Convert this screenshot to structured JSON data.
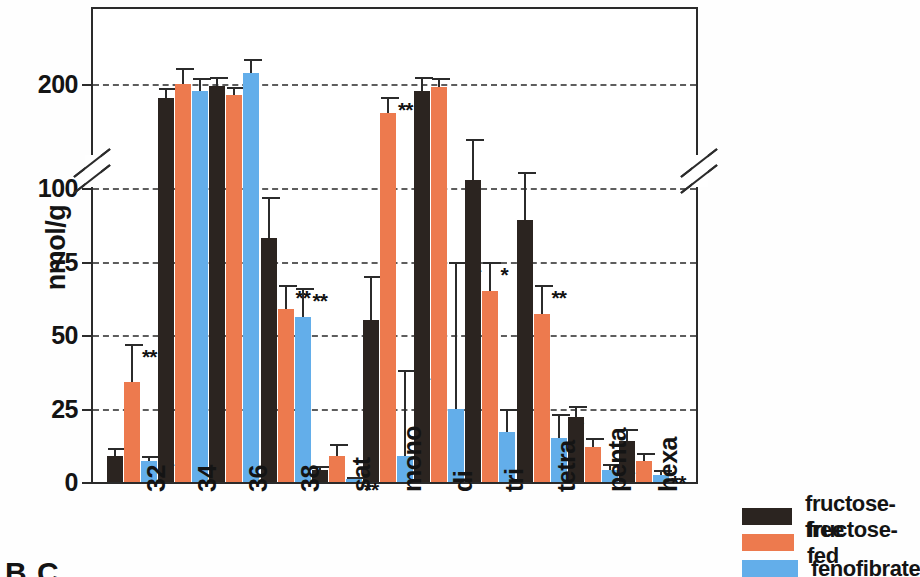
{
  "chart_data": {
    "type": "bar",
    "title": "",
    "xlabel": "",
    "ylabel": "nmol/g",
    "ylim": [
      0,
      230
    ],
    "grid": true,
    "axis_break": {
      "present": true,
      "lower_max": 110,
      "upper_min": 110
    },
    "legend_position": "bottom-right",
    "categories": [
      "32",
      "34",
      "36",
      "38",
      "sat",
      "mono",
      "di",
      "tri",
      "tetra",
      "penta",
      "hexa"
    ],
    "tick_labels": [
      "0",
      "25",
      "50",
      "75",
      "100",
      "200"
    ],
    "series": [
      {
        "name": "fructose-free",
        "color": "#2b2420",
        "values": [
          9,
          180,
          197,
          83,
          4,
          55,
          190,
          102,
          89,
          22,
          14
        ],
        "errors": [
          2.5,
          14,
          13,
          14,
          1.5,
          15,
          20,
          22,
          15,
          4,
          4
        ],
        "significance": [
          "",
          "",
          "",
          "",
          "",
          "",
          "",
          "",
          "",
          "",
          ""
        ]
      },
      {
        "name": "fructose-fed",
        "color": "#ed7a4e",
        "values": [
          34,
          200,
          185,
          59,
          9,
          160,
          196,
          65,
          57,
          12,
          7
        ],
        "errors": [
          13,
          22,
          11,
          8,
          4,
          22,
          13,
          10,
          10,
          3,
          3
        ],
        "significance": [
          "**",
          "",
          "",
          "**",
          "",
          "**",
          "",
          "*",
          "**",
          "",
          ""
        ]
      },
      {
        "name": "fenofibrate",
        "color": "#63aeea",
        "values": [
          7,
          190,
          215,
          56,
          1,
          9,
          25,
          17,
          15,
          4,
          2.5
        ],
        "errors": [
          2,
          18,
          20,
          10,
          0.8,
          29,
          50,
          8,
          8,
          2,
          1.5
        ],
        "significance": [
          "**",
          "",
          "",
          "**",
          "**",
          "**",
          "**",
          "*",
          "**",
          "**",
          "**"
        ]
      }
    ]
  },
  "axis": {
    "y_title": "nmol/g",
    "ticks": [
      {
        "label": "0",
        "value": 0
      },
      {
        "label": "25",
        "value": 25
      },
      {
        "label": "50",
        "value": 50
      },
      {
        "label": "75",
        "value": 75
      },
      {
        "label": "100",
        "value": 100
      },
      {
        "label": "200",
        "value": 200
      }
    ]
  },
  "legend": {
    "items": [
      {
        "label": "fructose-free",
        "color": "#2b2420"
      },
      {
        "label": "fructose-fed",
        "color": "#ed7a4e"
      },
      {
        "label": "fenofibrate",
        "color": "#63aeea"
      }
    ]
  },
  "panel_tag": "B.C"
}
